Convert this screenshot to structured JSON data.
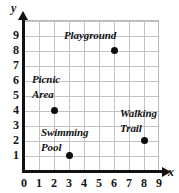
{
  "chart_data": {
    "type": "scatter",
    "title": "",
    "xlabel": "x",
    "ylabel": "y",
    "xlim": [
      0,
      9
    ],
    "ylim": [
      0,
      9
    ],
    "grid": true,
    "legend": "none",
    "x_ticks": [
      "0",
      "1",
      "2",
      "3",
      "4",
      "5",
      "6",
      "7",
      "8",
      "9"
    ],
    "y_ticks": [
      "1",
      "2",
      "3",
      "4",
      "5",
      "6",
      "7",
      "8",
      "9"
    ],
    "points": [
      {
        "label": "Playground",
        "label_line1": "Playground",
        "label_line2": "",
        "x": 6,
        "y": 8
      },
      {
        "label": "Picnic Area",
        "label_line1": "Picnic",
        "label_line2": "Area",
        "x": 2,
        "y": 4
      },
      {
        "label": "Swimming Pool",
        "label_line1": "Swimming",
        "label_line2": "Pool",
        "x": 3,
        "y": 1
      },
      {
        "label": "Walking Trail",
        "label_line1": "Walking",
        "label_line2": "Trail",
        "x": 8,
        "y": 2
      }
    ],
    "colors": {
      "point": "#0d0d0d",
      "axis": "#121212",
      "grid": "#c3c3c7",
      "text": "#111111",
      "background": "#ffffff"
    }
  }
}
